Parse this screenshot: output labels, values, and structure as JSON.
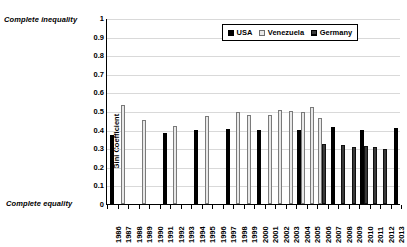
{
  "chart_data": {
    "type": "bar",
    "title": "",
    "xlabel": "",
    "ylabel": "Gini Coefficient",
    "ylim": [
      0,
      1
    ],
    "ytick_labels": [
      "1",
      "0.9",
      "0.8",
      "0.7",
      "0.6",
      "0.5",
      "0.4",
      "0.3",
      "0.2",
      "0.1",
      "0"
    ],
    "ytick_values": [
      1,
      0.9,
      0.8,
      0.7,
      0.6,
      0.5,
      0.4,
      0.3,
      0.2,
      0.1,
      0
    ],
    "grid": true,
    "legend_position": "top-right",
    "categories": [
      "1986",
      "1987",
      "1988",
      "1989",
      "1990",
      "1991",
      "1992",
      "1993",
      "1994",
      "1995",
      "1996",
      "1997",
      "1998",
      "1999",
      "2000",
      "2001",
      "2002",
      "2003",
      "2004",
      "2005",
      "2006",
      "2007",
      "2008",
      "2009",
      "2010",
      "2011",
      "2012",
      "2013"
    ],
    "series": [
      {
        "name": "USA",
        "color": "#000000",
        "values": [
          0.37,
          null,
          null,
          null,
          null,
          0.38,
          null,
          null,
          0.4,
          null,
          null,
          0.405,
          null,
          null,
          0.4,
          null,
          null,
          null,
          0.4,
          null,
          null,
          0.415,
          null,
          null,
          0.4,
          null,
          null,
          0.41
        ]
      },
      {
        "name": "Venezuela",
        "color": "#e8e8e8",
        "values": [
          null,
          0.53,
          null,
          0.45,
          null,
          null,
          0.42,
          null,
          null,
          0.475,
          null,
          null,
          0.495,
          0.48,
          null,
          0.48,
          0.505,
          0.5,
          0.495,
          0.52,
          0.465,
          null,
          null,
          null,
          null,
          null,
          null,
          null
        ]
      },
      {
        "name": "Germany",
        "color": "#3a3a3a",
        "values": [
          null,
          null,
          null,
          null,
          null,
          null,
          null,
          null,
          null,
          null,
          null,
          null,
          null,
          null,
          null,
          null,
          null,
          null,
          null,
          null,
          0.32,
          null,
          0.315,
          0.305,
          0.31,
          0.305,
          0.295,
          null
        ]
      }
    ]
  },
  "annotations": {
    "top_label": "Complete inequality",
    "bottom_label": "Complete equality"
  },
  "legend": {
    "items": [
      {
        "label": "USA",
        "swatch": "usa"
      },
      {
        "label": "Venezuela",
        "swatch": "venezuela"
      },
      {
        "label": "Germany",
        "swatch": "germany"
      }
    ]
  }
}
